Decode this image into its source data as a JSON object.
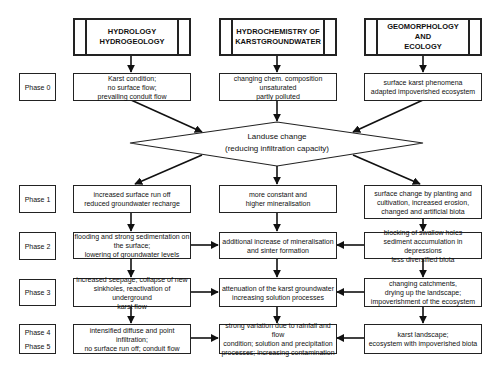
{
  "headers": [
    {
      "label": "HYDROLOGY\nHYDROGEOLOGY"
    },
    {
      "label": "HYDROCHEMISTRY OF\nKARSTGROUNDWATER"
    },
    {
      "label": "GEOMORPHOLOGY\nAND\nECOLOGY"
    }
  ],
  "phases": [
    "Phase 0",
    "Phase 1",
    "Phase 2",
    "Phase 3",
    "Phase 4",
    "Phase 5"
  ],
  "phase0": {
    "hydrology": "Karst condition;\nno surface flow;\nprevailing conduit flow",
    "hydrochemistry": "changing chem. composition\nunsaturated\npartly polluted",
    "geomorphology": "surface karst phenomena\nadapted impoverished ecosystem"
  },
  "decision": {
    "line1": "Landuse change",
    "line2": "(reducing infiltration capacity)"
  },
  "phase1": {
    "hydrology": "increased surface run off\nreduced groundwater recharge",
    "hydrochemistry": "more constant and\nhigher mineralisation",
    "geomorphology": "surface change by planting and\ncultivation, increased erosion,\nchanged and artificial biota"
  },
  "phase2": {
    "hydrology": "flooding and strong sedimentation on\nthe surface;\nlowering of groundwater levels",
    "hydrochemistry": "additional increase of mineralisation\nand sinter formation",
    "geomorphology": "blocking of swallow holes\nsediment accumulation in depressions\nless diversified biota"
  },
  "phase3": {
    "hydrology": "increased seepage, collapse of new\nsinkholes, reactivation of underground\nkarst flow",
    "hydrochemistry": "attenuation of the karst groundwater\nincreasing solution processes",
    "geomorphology": "changing catchments,\ndrying up the landscape;\nimpoverishment of the ecosystem"
  },
  "phase45": {
    "hydrology": "intensified diffuse and point infiltration;\nno surface run off; conduit flow",
    "hydrochemistry": "strong variation due to rainfall and flow\ncondition; solution and precipitation\nprocesses; increasing contamination",
    "geomorphology": "karst landscape;\necosystem with impoverished biota"
  }
}
